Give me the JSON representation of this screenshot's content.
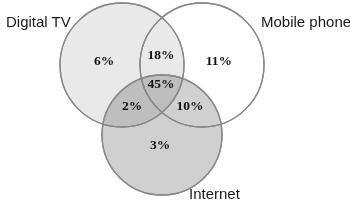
{
  "diagram": {
    "type": "venn",
    "sets": [
      {
        "id": "digital_tv",
        "label": "Digital TV",
        "fill": "#e9e9e9"
      },
      {
        "id": "mobile_phone",
        "label": "Mobile phone",
        "fill": "#ffffff"
      },
      {
        "id": "internet",
        "label": "Internet",
        "fill": "#d0d0d0"
      }
    ],
    "regions": {
      "digital_tv_only": "6%",
      "mobile_phone_only": "11%",
      "internet_only": "3%",
      "digital_tv_and_mobile_phone": "18%",
      "digital_tv_and_internet": "2%",
      "mobile_phone_and_internet": "10%",
      "all_three": "45%"
    }
  }
}
